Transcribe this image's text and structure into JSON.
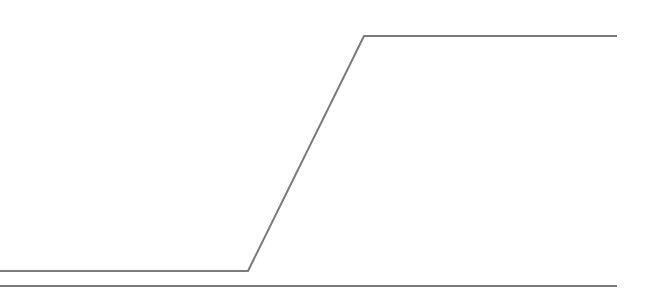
{
  "chart_data": {
    "type": "line",
    "title": "",
    "xlabel": "",
    "ylabel": "",
    "grid": false,
    "legend": null,
    "series": [
      {
        "name": "step",
        "color": "#7a7a7a",
        "points": [
          [
            0,
            271
          ],
          [
            248,
            271
          ],
          [
            364,
            36
          ],
          [
            617,
            36
          ]
        ]
      }
    ],
    "baseline": {
      "color": "#7a7a7a",
      "y": 286,
      "x_start": 0,
      "x_end": 617
    }
  }
}
